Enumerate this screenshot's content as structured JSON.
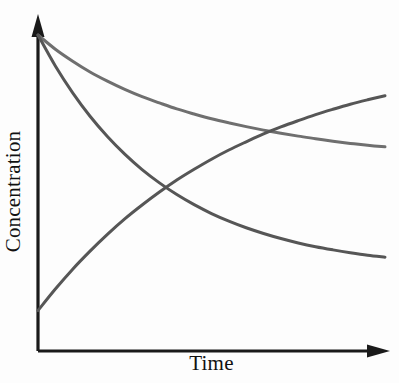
{
  "figure": {
    "background_color": "#fdfdfd",
    "axis_color": "#1a1a1a",
    "y_axis_label": "Concentration",
    "x_axis_label": "Time"
  },
  "chart_data": {
    "type": "line",
    "title": "",
    "subtitle": "",
    "xlabel": "Time",
    "ylabel": "Concentration",
    "xlim": [
      0,
      1
    ],
    "ylim": [
      0,
      1
    ],
    "grid": false,
    "legend": "none",
    "axis_style": "arrow-tipped open axes, no tick marks, no tick labels",
    "annotations": [
      "Two curves decay from the same maximum concentration at t = 0",
      "One curve rises from a low initial concentration toward a plateau",
      "Fast-decay curve crosses the rising curve near the middle of the plot",
      "Slow-decay curve crosses the rising curve near the right edge of the plot"
    ],
    "crossing_points": [
      {
        "label": "fast-decay x rising",
        "x": 0.447,
        "y": 0.547
      },
      {
        "label": "slow-decay x rising",
        "x": 0.928,
        "y": 0.705
      }
    ],
    "x": [
      0,
      0.05,
      0.1,
      0.15,
      0.2,
      0.25,
      0.3,
      0.35,
      0.4,
      0.45,
      0.5,
      0.55,
      0.6,
      0.65,
      0.7,
      0.75,
      0.8,
      0.85,
      0.9,
      0.95,
      1
    ],
    "series": [
      {
        "name": "slow-decay",
        "color": "#6f6f6f",
        "line_width": 3,
        "shape": "exponential decay, slow rate",
        "values": [
          1.0,
          0.955,
          0.917,
          0.883,
          0.854,
          0.828,
          0.805,
          0.785,
          0.766,
          0.75,
          0.735,
          0.722,
          0.71,
          0.699,
          0.689,
          0.68,
          0.672,
          0.664,
          0.657,
          0.651,
          0.646
        ]
      },
      {
        "name": "fast-decay",
        "color": "#565656",
        "line_width": 3,
        "shape": "exponential decay, fast rate",
        "values": [
          1.0,
          0.902,
          0.817,
          0.743,
          0.679,
          0.623,
          0.574,
          0.532,
          0.495,
          0.463,
          0.435,
          0.411,
          0.39,
          0.372,
          0.356,
          0.342,
          0.33,
          0.32,
          0.311,
          0.303,
          0.297
        ]
      },
      {
        "name": "rising",
        "color": "#565656",
        "line_width": 3,
        "shape": "exponential approach to plateau",
        "values": [
          0.128,
          0.196,
          0.259,
          0.316,
          0.369,
          0.418,
          0.462,
          0.503,
          0.541,
          0.575,
          0.607,
          0.636,
          0.662,
          0.687,
          0.709,
          0.729,
          0.748,
          0.765,
          0.781,
          0.795,
          0.808
        ]
      }
    ]
  }
}
